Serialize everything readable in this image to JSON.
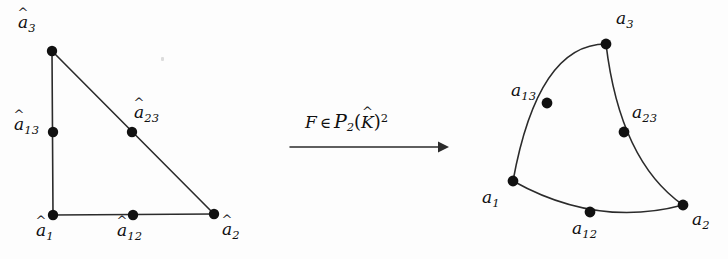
{
  "figure": {
    "type": "mathematical-diagram",
    "background_color": "#fdfdfd",
    "ink_color": "#2b2b2b",
    "width": 728,
    "height": 259
  },
  "left_panel": {
    "name": "reference-triangle",
    "description": "straight-edged reference triangle with vertex and midpoint nodes",
    "vertices": [
      {
        "id": "a1hat",
        "label_base": "a",
        "label_sub": "1",
        "hat": "^",
        "x": 53,
        "y": 215,
        "label_x": 36,
        "label_y": 222
      },
      {
        "id": "a2hat",
        "label_base": "a",
        "label_sub": "2",
        "hat": "^",
        "x": 214,
        "y": 214,
        "label_x": 222,
        "label_y": 221
      },
      {
        "id": "a3hat",
        "label_base": "a",
        "label_sub": "3",
        "hat": "^",
        "x": 52,
        "y": 51,
        "label_x": 18,
        "label_y": 14
      }
    ],
    "midnodes": [
      {
        "id": "a12hat",
        "label_base": "a",
        "label_sub": "12",
        "hat": "^",
        "x": 133,
        "y": 215,
        "label_x": 117,
        "label_y": 222
      },
      {
        "id": "a13hat",
        "label_base": "a",
        "label_sub": "13",
        "hat": "^",
        "x": 53,
        "y": 132,
        "label_x": 14,
        "label_y": 116
      },
      {
        "id": "a23hat",
        "label_base": "a",
        "label_sub": "23",
        "hat": "^",
        "x": 132,
        "y": 132,
        "label_x": 134,
        "label_y": 104
      }
    ],
    "edges": [
      {
        "id": "edge-a1-a3",
        "path": "M 53 215 L 52 51"
      },
      {
        "id": "edge-a1-a2",
        "path": "M 53 215 L 214 214"
      },
      {
        "id": "edge-a3-a2",
        "path": "M 52 51 L 214 214"
      }
    ],
    "node_radius": 5.2
  },
  "arrow": {
    "name": "mapping-arrow",
    "line_path": "M 290 147 L 438 147",
    "head_points": "438,141.6 449,147 438,152.4",
    "label": {
      "map_symbol": "F",
      "membership": "∈",
      "space_symbol": "P",
      "space_sub": "2",
      "open_paren": "(",
      "domain_symbol": "K",
      "domain_hat": "^",
      "close_paren": ")",
      "power": "2",
      "full_text": "F ∈ P2(K̂)²",
      "x": 305,
      "y": 110
    }
  },
  "right_panel": {
    "name": "curved-triangle",
    "description": "curvilinear image triangle with curved edges through midside nodes",
    "vertices": [
      {
        "id": "a1",
        "label_base": "a",
        "label_sub": "1",
        "x": 513,
        "y": 181,
        "label_x": 482,
        "label_y": 189
      },
      {
        "id": "a2",
        "label_base": "a",
        "label_sub": "2",
        "x": 683,
        "y": 205,
        "label_x": 692,
        "label_y": 211
      },
      {
        "id": "a3",
        "label_base": "a",
        "label_sub": "3",
        "x": 606,
        "y": 44,
        "label_x": 616,
        "label_y": 10
      }
    ],
    "midnodes": [
      {
        "id": "a12",
        "label_base": "a",
        "label_sub": "12",
        "x": 590,
        "y": 212,
        "label_x": 572,
        "label_y": 220
      },
      {
        "id": "a13",
        "label_base": "a",
        "label_sub": "13",
        "x": 547,
        "y": 103,
        "label_x": 511,
        "label_y": 82
      },
      {
        "id": "a23",
        "label_base": "a",
        "label_sub": "23",
        "x": 624,
        "y": 132,
        "label_x": 632,
        "label_y": 104
      }
    ],
    "edges": [
      {
        "id": "edge-a1-a3-curved",
        "path": "M 513 181 Q 538 44 606 44"
      },
      {
        "id": "edge-a3-a2-curved",
        "path": "M 606 44 Q 620 161 683 205"
      },
      {
        "id": "edge-a1-a2-curved",
        "path": "M 513 181 Q 597 228 683 205"
      }
    ],
    "node_radius": 5.4
  }
}
